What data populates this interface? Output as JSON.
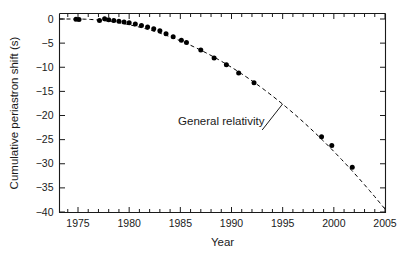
{
  "chart_data": {
    "type": "scatter",
    "title": "",
    "xlabel": "Year",
    "ylabel": "Cumulative periastron shift (s)",
    "xlim": [
      1973.8,
      2005.0
    ],
    "ylim": [
      -40,
      1.2
    ],
    "xticks": [
      1975,
      1980,
      1985,
      1990,
      1995,
      2000,
      2005
    ],
    "xtick_labels": [
      "1975",
      "1980",
      "1985",
      "1990",
      "1995",
      "2000",
      "2005"
    ],
    "xminor_step": 1,
    "yticks": [
      0,
      -5,
      -10,
      -15,
      -20,
      -25,
      -30,
      -35,
      -40
    ],
    "ytick_labels": [
      "0",
      "−5",
      "−10",
      "−15",
      "−20",
      "−25",
      "−30",
      "−35",
      "−40"
    ],
    "grid": false,
    "legend": "none",
    "series": [
      {
        "name": "Observed data",
        "marker": "filled-circle",
        "color": "#000000",
        "points": [
          {
            "x": 1974.8,
            "y": -0.05
          },
          {
            "x": 1975.1,
            "y": -0.08
          },
          {
            "x": 1977.1,
            "y": -0.3
          },
          {
            "x": 1977.6,
            "y": 0.05
          },
          {
            "x": 1978.0,
            "y": -0.15
          },
          {
            "x": 1978.5,
            "y": -0.3
          },
          {
            "x": 1979.0,
            "y": -0.45
          },
          {
            "x": 1979.5,
            "y": -0.6
          },
          {
            "x": 1980.0,
            "y": -0.8
          },
          {
            "x": 1980.6,
            "y": -1.05
          },
          {
            "x": 1981.2,
            "y": -1.35
          },
          {
            "x": 1981.8,
            "y": -1.65
          },
          {
            "x": 1982.4,
            "y": -2.0
          },
          {
            "x": 1983.0,
            "y": -2.45
          },
          {
            "x": 1983.6,
            "y": -3.05
          },
          {
            "x": 1984.3,
            "y": -3.7
          },
          {
            "x": 1985.1,
            "y": -4.4
          },
          {
            "x": 1985.6,
            "y": -4.85
          },
          {
            "x": 1987.0,
            "y": -6.45
          },
          {
            "x": 1988.3,
            "y": -8.1
          },
          {
            "x": 1989.5,
            "y": -9.5
          },
          {
            "x": 1990.7,
            "y": -11.2
          },
          {
            "x": 1992.2,
            "y": -13.2
          },
          {
            "x": 1998.8,
            "y": -24.4
          },
          {
            "x": 1999.8,
            "y": -26.2
          },
          {
            "x": 2001.8,
            "y": -30.7
          }
        ]
      },
      {
        "name": "General relativity",
        "style": "dashed",
        "color": "#000000",
        "model": "quadratic",
        "t0": 1974.75,
        "coefficient": -0.04305,
        "endpoints": [
          {
            "x": 1974.75,
            "y": 0
          },
          {
            "x": 2005.0,
            "y": -39.4
          }
        ]
      }
    ],
    "annotations": [
      {
        "text": "General relativity",
        "text_x": 1989.0,
        "text_y": -22.0,
        "leader_from": {
          "x": 1993.0,
          "y": -23.0
        },
        "leader_to": {
          "x": 1995.0,
          "y": -17.6
        }
      }
    ]
  },
  "figure": {
    "xlabel": "Year",
    "ylabel": "Cumulative periastron shift (s)",
    "annotation_label": "General relativity",
    "xtick_labels": [
      "1975",
      "1980",
      "1985",
      "1990",
      "1995",
      "2000",
      "2005"
    ],
    "ytick_labels": [
      "0",
      "−5",
      "−10",
      "−15",
      "−20",
      "−25",
      "−30",
      "−35",
      "−40"
    ],
    "colors": {
      "background": "#ffffff",
      "axis": "#1a1a1a",
      "marker": "#000000",
      "curve": "#000000",
      "text": "#1a1a1a"
    }
  }
}
